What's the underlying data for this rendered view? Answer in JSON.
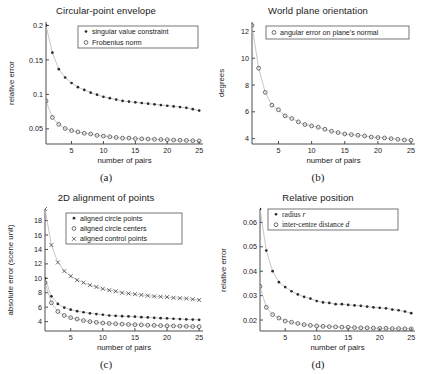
{
  "figure": {
    "background": "#ffffff",
    "marker_colors": {
      "filled_dot": "#2b2b2b",
      "open_circle": "#4a4a4a",
      "cross": "#4a4a4a",
      "trend_line": "#b9b9b9"
    }
  },
  "panels": [
    {
      "id": "a",
      "caption": "(a)",
      "chart_data": {
        "type": "scatter",
        "title": "Circular-point envelope",
        "xlabel": "number of pairs",
        "ylabel": "relative error",
        "xlim": [
          1,
          25.6
        ],
        "ylim": [
          0.028,
          0.205
        ],
        "xticks": [
          5,
          10,
          15,
          20,
          25
        ],
        "yticks": [
          0.05,
          0.1,
          0.15,
          0.2
        ],
        "ytick_labels": [
          "0.05",
          "0.1",
          "0.15",
          "0.2"
        ],
        "grid": false,
        "legend_position": "top-right",
        "x": [
          1,
          2,
          3,
          4,
          5,
          6,
          7,
          8,
          9,
          10,
          11,
          12,
          13,
          14,
          15,
          16,
          17,
          18,
          19,
          20,
          21,
          22,
          23,
          24,
          25
        ],
        "series": [
          {
            "name": "singular value constraint",
            "marker": "filled_dot",
            "values": [
              0.2,
              0.1605,
              0.1365,
              0.1245,
              0.1165,
              0.1105,
              0.1065,
              0.1025,
              0.0995,
              0.0965,
              0.0945,
              0.0925,
              0.0905,
              0.0895,
              0.0885,
              0.0875,
              0.0865,
              0.0855,
              0.0845,
              0.0835,
              0.0825,
              0.0815,
              0.0805,
              0.0785,
              0.0765
            ]
          },
          {
            "name": "Frobenius norm",
            "marker": "open_circle",
            "values": [
              0.0905,
              0.0665,
              0.0565,
              0.0505,
              0.0475,
              0.0455,
              0.0435,
              0.0425,
              0.0405,
              0.0395,
              0.0385,
              0.0375,
              0.0365,
              0.0365,
              0.0358,
              0.0355,
              0.0352,
              0.0348,
              0.0345,
              0.0342,
              0.0338,
              0.0335,
              0.0332,
              0.0328,
              0.0325
            ]
          }
        ]
      }
    },
    {
      "id": "b",
      "caption": "(b)",
      "chart_data": {
        "type": "scatter",
        "title": "World plane orientation",
        "xlabel": "number of pairs",
        "ylabel": "degrees",
        "xlim": [
          1,
          25.6
        ],
        "ylim": [
          3.6,
          12.7
        ],
        "xticks": [
          5,
          10,
          15,
          20,
          25
        ],
        "yticks": [
          4,
          6,
          8,
          10,
          12
        ],
        "ytick_labels": [
          "4",
          "6",
          "8",
          "10",
          "12"
        ],
        "grid": false,
        "legend_position": "top-right",
        "x": [
          1,
          2,
          3,
          4,
          5,
          6,
          7,
          8,
          9,
          10,
          11,
          12,
          13,
          14,
          15,
          16,
          17,
          18,
          19,
          20,
          21,
          22,
          23,
          24,
          25
        ],
        "series": [
          {
            "name": "angular error on plane's normal",
            "marker": "open_circle",
            "values": [
              12.45,
              9.25,
              7.45,
              6.5,
              6.15,
              5.7,
              5.5,
              5.25,
              5.05,
              4.95,
              4.85,
              4.7,
              4.55,
              4.45,
              4.35,
              4.3,
              4.25,
              4.2,
              4.12,
              4.08,
              4.05,
              4.0,
              3.95,
              3.9,
              3.88
            ]
          }
        ]
      }
    },
    {
      "id": "c",
      "caption": "(c)",
      "chart_data": {
        "type": "scatter",
        "title": "2D alignment of points",
        "xlabel": "number of pairs",
        "ylabel": "absolute error (scene unit)",
        "xlim": [
          1,
          25.6
        ],
        "ylim": [
          2.7,
          19.6
        ],
        "xticks": [
          5,
          10,
          15,
          20,
          25
        ],
        "yticks": [
          4,
          6,
          8,
          10,
          12,
          14,
          16,
          18
        ],
        "ytick_labels": [
          "4",
          "6",
          "8",
          "10",
          "12",
          "14",
          "16",
          "18"
        ],
        "grid": false,
        "legend_position": "top-right",
        "x": [
          1,
          2,
          3,
          4,
          5,
          6,
          7,
          8,
          9,
          10,
          11,
          12,
          13,
          14,
          15,
          16,
          17,
          18,
          19,
          20,
          21,
          22,
          23,
          24,
          25
        ],
        "series": [
          {
            "name": "aligned circle points",
            "marker": "filled_dot",
            "values": [
              10.0,
              7.5,
              6.45,
              5.95,
              5.65,
              5.45,
              5.3,
              5.15,
              5.05,
              4.95,
              4.85,
              4.8,
              4.75,
              4.72,
              4.68,
              4.62,
              4.58,
              4.52,
              4.48,
              4.45,
              4.4,
              4.35,
              4.32,
              4.28,
              4.25
            ]
          },
          {
            "name": "aligned circle centers",
            "marker": "open_circle",
            "values": [
              9.4,
              6.6,
              5.4,
              4.85,
              4.55,
              4.35,
              4.15,
              4.0,
              3.9,
              3.8,
              3.75,
              3.7,
              3.65,
              3.6,
              3.58,
              3.55,
              3.5,
              3.48,
              3.45,
              3.42,
              3.4,
              3.38,
              3.35,
              3.32,
              3.3
            ]
          },
          {
            "name": "aligned control points",
            "marker": "cross",
            "values": [
              19.6,
              14.6,
              12.2,
              11.0,
              10.3,
              9.75,
              9.4,
              9.05,
              8.8,
              8.55,
              8.35,
              8.2,
              8.0,
              7.9,
              7.8,
              7.7,
              7.6,
              7.5,
              7.45,
              7.4,
              7.3,
              7.25,
              7.2,
              7.1,
              7.0
            ]
          }
        ]
      }
    },
    {
      "id": "d",
      "caption": "(d)",
      "chart_data": {
        "type": "scatter",
        "title": "Relative position",
        "xlabel": "number of pairs",
        "ylabel": "relative error",
        "xlim": [
          1,
          25.6
        ],
        "ylim": [
          0.0155,
          0.0655
        ],
        "xticks": [
          5,
          10,
          15,
          20,
          25
        ],
        "yticks": [
          0.02,
          0.03,
          0.04,
          0.05,
          0.06
        ],
        "ytick_labels": [
          "0.02",
          "0.03",
          "0.04",
          "0.05",
          "0.06"
        ],
        "grid": false,
        "legend_position": "top-right",
        "x": [
          1,
          2,
          3,
          4,
          5,
          6,
          7,
          8,
          9,
          10,
          11,
          12,
          13,
          14,
          15,
          16,
          17,
          18,
          19,
          20,
          21,
          22,
          23,
          24,
          25
        ],
        "series": [
          {
            "name": "radius r",
            "name_parts": [
              {
                "t": "radius ",
                "i": false
              },
              {
                "t": "r",
                "i": true
              }
            ],
            "marker": "filled_dot",
            "values": [
              0.0655,
              0.0485,
              0.04,
              0.0355,
              0.0335,
              0.0318,
              0.0305,
              0.0295,
              0.0288,
              0.0278,
              0.0272,
              0.027,
              0.0265,
              0.0265,
              0.0262,
              0.026,
              0.0258,
              0.0255,
              0.0252,
              0.025,
              0.0248,
              0.0243,
              0.024,
              0.0235,
              0.0228
            ]
          },
          {
            "name": "inter-centre distance d",
            "name_parts": [
              {
                "t": "inter-centre distance ",
                "i": false
              },
              {
                "t": "d",
                "i": true
              }
            ],
            "marker": "open_circle",
            "values": [
              0.0338,
              0.0252,
              0.0222,
              0.0208,
              0.0196,
              0.0191,
              0.0186,
              0.0181,
              0.0178,
              0.0176,
              0.0174,
              0.0173,
              0.0172,
              0.0171,
              0.017,
              0.0169,
              0.0168,
              0.0168,
              0.0167,
              0.0166,
              0.0166,
              0.0165,
              0.0165,
              0.0164,
              0.0164
            ]
          }
        ]
      }
    }
  ]
}
